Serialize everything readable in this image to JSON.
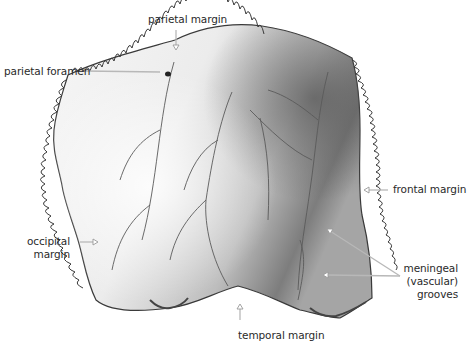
{
  "figure": {
    "colors": {
      "background": "#ffffff",
      "label_text": "#2a2a2a",
      "leader_line": "#b8b8b8",
      "bone_light": "#f4f4f4",
      "bone_mid": "#c8c8c8",
      "bone_dark": "#6e6e6e",
      "suture_outline": "#3a3a3a"
    }
  },
  "labels": {
    "parietal_margin": "parietal margin",
    "parietal_foramen": "parietal foramen",
    "frontal_margin": "frontal margin",
    "occipital_margin_line1": "occipital",
    "occipital_margin_line2": "margin",
    "meningeal_line1": "meningeal",
    "meningeal_line2": "(vascular)",
    "meningeal_line3": "grooves",
    "temporal_margin": "temporal margin"
  }
}
